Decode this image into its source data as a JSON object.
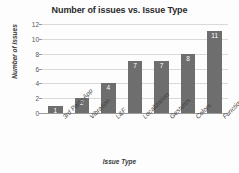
{
  "chart_data": {
    "type": "bar",
    "title": "Number of issues vs. Issue Type",
    "xlabel": "Issue Type",
    "ylabel": "Number of issues",
    "categories": [
      "3rd Party App",
      "Vibration",
      "L&F",
      "Localization",
      "Gestures",
      "Colors",
      "Function"
    ],
    "values": [
      1,
      2,
      4,
      7,
      7,
      8,
      11
    ],
    "value_labels": [
      "1",
      "2",
      "4",
      "7",
      "7",
      "8",
      "11"
    ],
    "ylim": [
      0,
      12
    ],
    "yticks": [
      0,
      2,
      4,
      6,
      8,
      10,
      12
    ],
    "ytick_labels": [
      "0",
      "2",
      "4",
      "6",
      "8",
      "10",
      "12"
    ],
    "grid": true,
    "legend": false,
    "bar_color": "#6e6e6e",
    "value_label_color": "#ffffff",
    "gridline_color": "#d9d9d9",
    "axis_color": "#9a9a9a",
    "background_color": "#fdfdfd"
  }
}
